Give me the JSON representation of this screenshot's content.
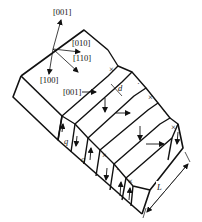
{
  "diagram": {
    "axes": {
      "a001_top": "[001]",
      "a010": "[010]",
      "a110": "[110]",
      "a100": "[100]"
    },
    "face_label_001": "[001]",
    "dimension_labels": {
      "d": "d",
      "q1": "q",
      "q2": "q",
      "L": "L"
    },
    "marks": {
      "cross": "×",
      "dot": "·"
    },
    "colors": {
      "line": "#111111",
      "background": "#ffffff"
    }
  }
}
